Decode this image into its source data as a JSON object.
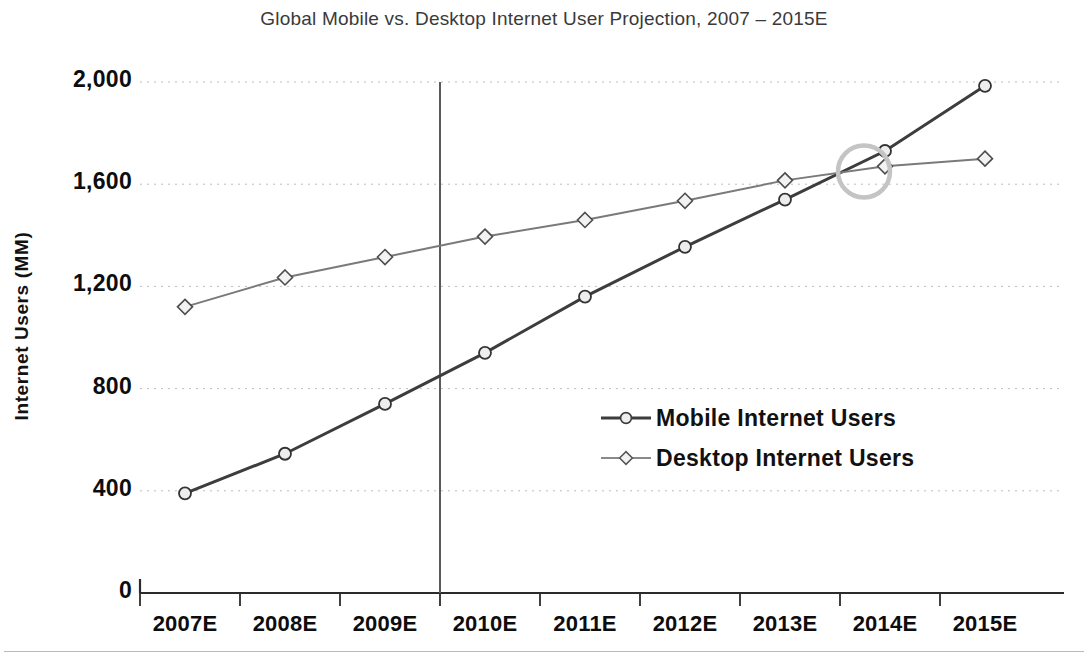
{
  "chart_data": {
    "type": "line",
    "title": "Global Mobile vs. Desktop Internet User Projection, 2007 – 2015E",
    "xlabel": "",
    "ylabel": "Internet Users (MM)",
    "categories": [
      "2007E",
      "2008E",
      "2009E",
      "2010E",
      "2011E",
      "2012E",
      "2013E",
      "2014E",
      "2015E"
    ],
    "ylim": [
      0,
      2000
    ],
    "yticks": [
      0,
      400,
      800,
      1200,
      1600,
      2000
    ],
    "ytick_labels": [
      "0",
      "400",
      "800",
      "1,200",
      "1,600",
      "2,000"
    ],
    "grid": "horizontal-dotted",
    "legend_position": "inside-center-right",
    "series": [
      {
        "name": "Mobile Internet Users",
        "values": [
          390,
          545,
          740,
          940,
          1160,
          1355,
          1540,
          1730,
          1985
        ],
        "color": "#3d3d3d",
        "line_width": 3,
        "marker": "circle"
      },
      {
        "name": "Desktop Internet Users",
        "values": [
          1120,
          1235,
          1315,
          1395,
          1460,
          1535,
          1615,
          1670,
          1700
        ],
        "color": "#7a7a7a",
        "line_width": 2,
        "marker": "diamond"
      }
    ],
    "annotations": [
      {
        "type": "ellipse-highlight",
        "label": "crossover-highlight",
        "x_between": [
          "2013E",
          "2014E"
        ],
        "approx_value": 1650,
        "color": "#c4c4c4"
      },
      {
        "type": "vertical-divider",
        "label": "projection-start-divider",
        "x_between": [
          "2009E",
          "2010E"
        ],
        "color": "#5a5a5a"
      }
    ]
  },
  "legend": {
    "items": [
      {
        "label": "Mobile Internet Users"
      },
      {
        "label": "Desktop Internet Users"
      }
    ]
  },
  "colors": {
    "mobile": "#3d3d3d",
    "desktop": "#7a7a7a",
    "axis": "#2b2b2b",
    "grid": "#bdbdbd",
    "highlight": "#c4c4c4",
    "title_text": "#3a3a3a",
    "tick_text": "#0d0d0d"
  }
}
